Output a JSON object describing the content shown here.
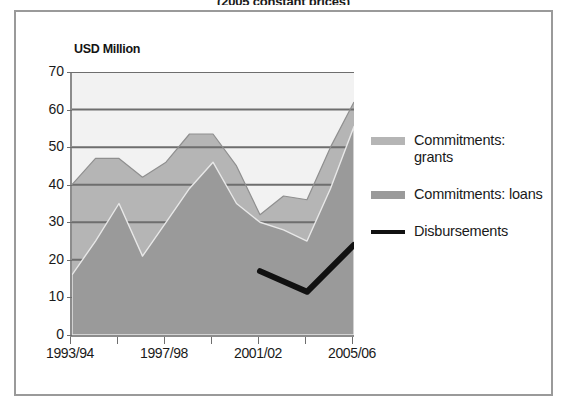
{
  "title": "(2005 constant prices)",
  "axis_unit_label": "USD Million",
  "legend": {
    "items": [
      {
        "label": "Commitments: grants",
        "swatch": "#b5b5b5",
        "type": "area"
      },
      {
        "label": "Commitments: loans",
        "swatch": "#9a9a9a",
        "type": "area"
      },
      {
        "label": "Disbursements",
        "swatch": "#111111",
        "type": "line"
      }
    ]
  },
  "chart_data": {
    "type": "area",
    "title": "(2005 constant prices)",
    "subtitle": "",
    "xlabel": "",
    "ylabel": "USD Million",
    "ylim": [
      0,
      70
    ],
    "yticks": [
      0,
      10,
      20,
      30,
      40,
      50,
      60,
      70
    ],
    "grid": true,
    "stacked": true,
    "legend_position": "right",
    "x": [
      "1993/94",
      "1994/95",
      "1995/96",
      "1996/97",
      "1997/98",
      "1998/99",
      "1999/00",
      "2000/01",
      "2001/02",
      "2002/03",
      "2003/04",
      "2004/05",
      "2005/06"
    ],
    "xtick_labels": [
      "1993/94",
      "1997/98",
      "2001/02",
      "2005/06"
    ],
    "xtick_label_indices": [
      0,
      4,
      8,
      12
    ],
    "series": [
      {
        "name": "Commitments: loans",
        "color": "#9a9a9a",
        "values": [
          16,
          25,
          35,
          21,
          30,
          39,
          46,
          35,
          30,
          28,
          25,
          39,
          55.5
        ]
      },
      {
        "name": "Commitments: grants",
        "color": "#b5b5b5",
        "values": [
          24,
          22,
          12,
          21,
          16,
          14.5,
          7.5,
          10,
          2,
          9,
          11,
          11,
          6.5
        ]
      },
      {
        "name": "Commitments: total",
        "color": "#b5b5b5",
        "values": [
          40,
          47,
          47,
          42,
          46,
          53.5,
          53.5,
          45,
          32,
          37,
          36,
          50,
          62
        ]
      },
      {
        "name": "Disbursements",
        "color": "#111111",
        "type": "line",
        "x": [
          "2001/02",
          "2003/04",
          "2005/06"
        ],
        "x_indices": [
          8,
          10,
          12
        ],
        "values": [
          17,
          11.5,
          24
        ]
      }
    ]
  }
}
